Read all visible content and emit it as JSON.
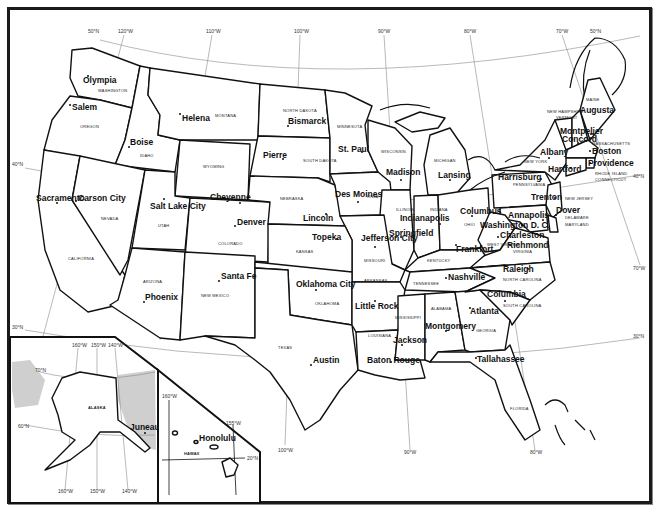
{
  "map": {
    "title": "United States — States and Capitals",
    "colors": {
      "border": "#111111",
      "graticule": "#8a8a8a",
      "land": "#ffffff",
      "foreign_land": "#cfcfcf"
    },
    "graticule_labels": {
      "top": [
        "50°N",
        "120°W",
        "110°W",
        "100°W",
        "90°W",
        "80°W",
        "70°W",
        "50°N"
      ],
      "left": [
        "40°N",
        "30°N"
      ],
      "right": [
        "40°N",
        "30°N",
        "70°W"
      ],
      "bottom": [
        "100°W",
        "90°W",
        "80°W"
      ]
    },
    "states": [
      {
        "name": "WASHINGTON",
        "capital": "Olympia"
      },
      {
        "name": "OREGON",
        "capital": "Salem"
      },
      {
        "name": "IDAHO",
        "capital": "Boise"
      },
      {
        "name": "MONTANA",
        "capital": "Helena"
      },
      {
        "name": "WYOMING",
        "capital": "Cheyenne"
      },
      {
        "name": "NORTH DAKOTA",
        "capital": "Bismarck"
      },
      {
        "name": "SOUTH DAKOTA",
        "capital": "Pierre"
      },
      {
        "name": "MINNESOTA",
        "capital": "St. Paul"
      },
      {
        "name": "WISCONSIN",
        "capital": "Madison"
      },
      {
        "name": "MICHIGAN",
        "capital": "Lansing"
      },
      {
        "name": "CALIFORNIA",
        "capital": "Sacramento"
      },
      {
        "name": "NEVADA",
        "capital": "Carson City"
      },
      {
        "name": "UTAH",
        "capital": "Salt Lake City"
      },
      {
        "name": "COLORADO",
        "capital": "Denver"
      },
      {
        "name": "NEBRASKA",
        "capital": "Lincoln"
      },
      {
        "name": "IOWA",
        "capital": "Des Moines"
      },
      {
        "name": "ILLINOIS",
        "capital": "Springfield"
      },
      {
        "name": "INDIANA",
        "capital": "Indianapolis"
      },
      {
        "name": "OHIO",
        "capital": "Columbus"
      },
      {
        "name": "PENNSYLVANIA",
        "capital": "Harrisburg"
      },
      {
        "name": "NEW YORK",
        "capital": "Albany"
      },
      {
        "name": "VERMONT",
        "capital": "Montpelier"
      },
      {
        "name": "NEW HAMPSHIRE",
        "capital": "Concord"
      },
      {
        "name": "MAINE",
        "capital": "Augusta"
      },
      {
        "name": "MASSACHUSETTS",
        "capital": "Boston"
      },
      {
        "name": "RHODE ISLAND",
        "capital": "Providence"
      },
      {
        "name": "CONNECTICUT",
        "capital": "Hartford"
      },
      {
        "name": "NEW JERSEY",
        "capital": "Trenton"
      },
      {
        "name": "DELAWARE",
        "capital": "Dover"
      },
      {
        "name": "MARYLAND",
        "capital": "Annapolis"
      },
      {
        "name": "WEST VIRGINIA",
        "capital": "Charleston"
      },
      {
        "name": "VIRGINIA",
        "capital": "Richmond"
      },
      {
        "name": "KENTUCKY",
        "capital": "Frankfort"
      },
      {
        "name": "MISSOURI",
        "capital": "Jefferson City"
      },
      {
        "name": "KANSAS",
        "capital": "Topeka"
      },
      {
        "name": "ARIZONA",
        "capital": "Phoenix"
      },
      {
        "name": "NEW MEXICO",
        "capital": "Santa Fe"
      },
      {
        "name": "OKLAHOMA",
        "capital": "Oklahoma City"
      },
      {
        "name": "TEXAS",
        "capital": "Austin"
      },
      {
        "name": "ARKANSAS",
        "capital": "Little Rock"
      },
      {
        "name": "LOUISIANA",
        "capital": "Baton Rouge"
      },
      {
        "name": "TENNESSEE",
        "capital": "Nashville"
      },
      {
        "name": "MISSISSIPPI",
        "capital": "Jackson"
      },
      {
        "name": "ALABAMA",
        "capital": "Montgomery"
      },
      {
        "name": "GEORGIA",
        "capital": "Atlanta"
      },
      {
        "name": "NORTH CAROLINA",
        "capital": "Raleigh"
      },
      {
        "name": "SOUTH CAROLINA",
        "capital": "Columbia"
      },
      {
        "name": "FLORIDA",
        "capital": "Tallahassee"
      },
      {
        "name": "ALASKA",
        "capital": "Juneau"
      },
      {
        "name": "HAWAII",
        "capital": "Honolulu"
      }
    ],
    "district": {
      "name": "Washington D. C."
    },
    "alaska_inset": {
      "state": "ALASKA",
      "capital": "Juneau",
      "top_labels": [
        "160°W",
        "150°W",
        "140°W"
      ],
      "bottom_labels": [
        "160°W",
        "150°W",
        "140°W"
      ],
      "lat_labels": [
        "70°N",
        "60°N"
      ]
    },
    "hawaii_inset": {
      "state": "HAWAII",
      "capital": "Honolulu",
      "labels": [
        "160°W",
        "155°W",
        "20°N"
      ]
    }
  }
}
